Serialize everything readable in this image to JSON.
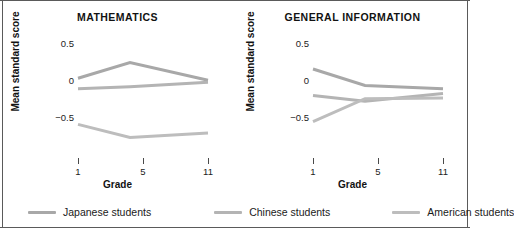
{
  "figure": {
    "ylabel": "Mean standard score",
    "xlabel": "Grade",
    "y_ticks": [
      "0.5",
      "0",
      "−0.5"
    ],
    "x_ticks": [
      "1",
      "5",
      "11"
    ]
  },
  "legend": {
    "items": [
      {
        "label": "Japanese students",
        "color": "#a8a8a8"
      },
      {
        "label": "Chinese students",
        "color": "#b4b4b4"
      },
      {
        "label": "American students",
        "color": "#bdbdbd"
      }
    ]
  },
  "chart_data": [
    {
      "type": "line",
      "title": "MATHEMATICS",
      "xlabel": "Grade",
      "ylabel": "Mean standard score",
      "x": [
        1,
        5,
        11
      ],
      "xtick_labels": [
        "1",
        "5",
        "11"
      ],
      "ylim": [
        -0.9,
        0.8
      ],
      "ytick_values": [
        0.5,
        0,
        -0.5
      ],
      "grid": false,
      "legend_position": "bottom",
      "series": [
        {
          "name": "Japanese students",
          "color": "#a8a8a8",
          "values": [
            0.28,
            0.52,
            0.25
          ]
        },
        {
          "name": "Chinese students",
          "color": "#b4b4b4",
          "values": [
            0.12,
            0.15,
            0.22
          ]
        },
        {
          "name": "American students",
          "color": "#bdbdbd",
          "values": [
            -0.42,
            -0.62,
            -0.55
          ]
        }
      ]
    },
    {
      "type": "line",
      "title": "GENERAL INFORMATION",
      "xlabel": "Grade",
      "ylabel": "Mean standard score",
      "x": [
        1,
        5,
        11
      ],
      "xtick_labels": [
        "1",
        "5",
        "11"
      ],
      "ylim": [
        -0.9,
        0.8
      ],
      "ytick_values": [
        0.5,
        0,
        -0.5
      ],
      "grid": false,
      "legend_position": "bottom",
      "series": [
        {
          "name": "Japanese students",
          "color": "#a8a8a8",
          "values": [
            0.42,
            0.17,
            0.12
          ]
        },
        {
          "name": "Chinese students",
          "color": "#b4b4b4",
          "values": [
            0.02,
            -0.07,
            0.05
          ]
        },
        {
          "name": "American students",
          "color": "#bdbdbd",
          "values": [
            -0.38,
            -0.03,
            -0.02
          ]
        }
      ]
    }
  ]
}
